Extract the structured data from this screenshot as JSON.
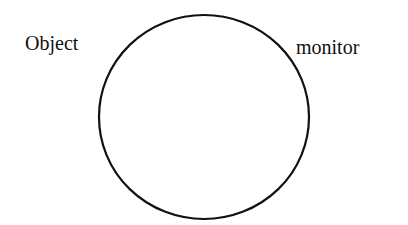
{
  "diagram": {
    "labels": {
      "left": "Object",
      "right": "monitor"
    },
    "shape": {
      "type": "circle",
      "stroke": "#111111",
      "fill": "#ffffff"
    }
  }
}
